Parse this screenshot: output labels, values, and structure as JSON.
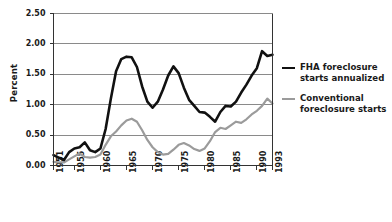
{
  "chart_data": {
    "type": "line",
    "title": "",
    "xlabel": "",
    "ylabel": "Percent",
    "ylim": [
      0.0,
      2.5
    ],
    "xlim": [
      1951,
      1993
    ],
    "grid": true,
    "legend_position": "right",
    "y_ticks": [
      "0.00",
      "0.50",
      "1.00",
      "1.50",
      "2.00",
      "2.50"
    ],
    "y_tick_values": [
      0.0,
      0.5,
      1.0,
      1.5,
      2.0,
      2.5
    ],
    "x_ticks": [
      "1951",
      "1955",
      "1960",
      "1965",
      "1970",
      "1975",
      "1980",
      "1985",
      "1990",
      "1993"
    ],
    "x_tick_values": [
      1951,
      1955,
      1960,
      1965,
      1970,
      1975,
      1980,
      1985,
      1990,
      1993
    ],
    "x": [
      1951,
      1952,
      1953,
      1954,
      1955,
      1956,
      1957,
      1958,
      1959,
      1960,
      1961,
      1962,
      1963,
      1964,
      1965,
      1966,
      1967,
      1968,
      1969,
      1970,
      1971,
      1972,
      1973,
      1974,
      1975,
      1976,
      1977,
      1978,
      1979,
      1980,
      1981,
      1982,
      1983,
      1984,
      1985,
      1986,
      1987,
      1988,
      1989,
      1990,
      1991,
      1992,
      1993
    ],
    "series": [
      {
        "name": "FHA foreclosure starts annualized",
        "color": "#111111",
        "width": 2.6,
        "values": [
          0.17,
          0.13,
          0.09,
          0.22,
          0.28,
          0.3,
          0.38,
          0.25,
          0.22,
          0.28,
          0.6,
          1.1,
          1.55,
          1.75,
          1.79,
          1.78,
          1.62,
          1.3,
          1.05,
          0.95,
          1.05,
          1.25,
          1.48,
          1.63,
          1.52,
          1.28,
          1.08,
          0.98,
          0.88,
          0.87,
          0.8,
          0.72,
          0.88,
          0.98,
          0.97,
          1.05,
          1.2,
          1.33,
          1.48,
          1.6,
          1.88,
          1.8,
          1.82
        ]
      },
      {
        "name": "Conventional foreclosure starts",
        "color": "#9b9b9b",
        "width": 2.2,
        "values": [
          0.06,
          0.05,
          0.05,
          0.1,
          0.15,
          0.2,
          0.14,
          0.13,
          0.14,
          0.18,
          0.34,
          0.48,
          0.56,
          0.66,
          0.74,
          0.77,
          0.72,
          0.58,
          0.42,
          0.3,
          0.22,
          0.18,
          0.19,
          0.26,
          0.34,
          0.37,
          0.33,
          0.27,
          0.24,
          0.28,
          0.4,
          0.55,
          0.62,
          0.6,
          0.66,
          0.72,
          0.7,
          0.76,
          0.84,
          0.9,
          0.98,
          1.1,
          1.02
        ]
      }
    ]
  },
  "legend": {
    "items": [
      {
        "label_line1": "FHA foreclosure",
        "label_line2": "starts annualized",
        "style": "black"
      },
      {
        "label_line1": "Conventional",
        "label_line2": "foreclosure starts",
        "style": "gray"
      }
    ]
  }
}
